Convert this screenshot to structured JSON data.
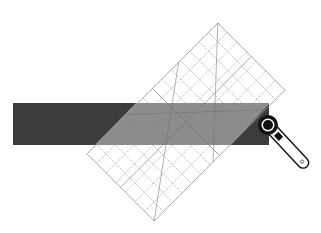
{
  "colors": {
    "background": "#ffffff",
    "fabric_dark": "#3b3b3b",
    "fabric_under_ruler": "#8c8c8c",
    "ruler_grid": "#8a8a8a",
    "cutter_body": "#111111",
    "cutter_handle": "#ffffff"
  },
  "elements": {
    "fabric_strip": {
      "label": "fabric strip",
      "x": 13,
      "y": 103,
      "width": 256,
      "height": 42
    },
    "ruler": {
      "label": "quilting ruler",
      "center_x": 186,
      "center_y": 122,
      "width": 95,
      "length": 185,
      "rotation_deg": 45,
      "grid_cols": 7,
      "grid_rows": 14
    },
    "rotary_cutter": {
      "label": "rotary cutter",
      "blade_x": 268,
      "blade_y": 125,
      "handle_end_x": 303,
      "handle_end_y": 166
    }
  }
}
